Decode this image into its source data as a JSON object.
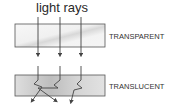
{
  "diagram": {
    "title": "light rays",
    "panels": [
      {
        "label": "TRANSPARENT",
        "ray_behavior": "straight through"
      },
      {
        "label": "TRANSLUCENT",
        "ray_behavior": "scattered"
      }
    ],
    "colors": {
      "box_fill_light": "#f2f2f2",
      "box_fill_dark": "#cfcfcf",
      "line": "#444444"
    }
  }
}
